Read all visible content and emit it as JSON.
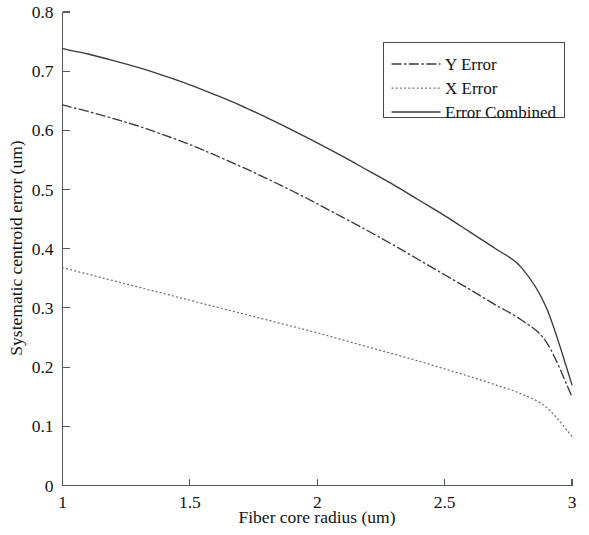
{
  "chart_data": {
    "type": "line",
    "title": "",
    "xlabel": "Fiber core radius (um)",
    "ylabel": "Systematic centroid error (um)",
    "xlim": [
      1,
      3
    ],
    "ylim": [
      0,
      0.8
    ],
    "xticks": [
      1,
      1.5,
      2,
      2.5,
      3
    ],
    "xtick_labels": [
      "1",
      "1.5",
      "2",
      "2.5",
      "3"
    ],
    "yticks": [
      0,
      0.1,
      0.2,
      0.3,
      0.4,
      0.5,
      0.6,
      0.7,
      0.8
    ],
    "ytick_labels": [
      "0",
      "0.1",
      "0.2",
      "0.3",
      "0.4",
      "0.5",
      "0.6",
      "0.7",
      "0.8"
    ],
    "grid": false,
    "legend_position": "upper right",
    "x": [
      1.0,
      1.1,
      1.2,
      1.3,
      1.4,
      1.5,
      1.6,
      1.7,
      1.8,
      1.9,
      2.0,
      2.1,
      2.2,
      2.3,
      2.4,
      2.5,
      2.6,
      2.7,
      2.8,
      2.9,
      3.0
    ],
    "series": [
      {
        "name": "Y Error",
        "style": "dashdot",
        "color": "#3a3a3a",
        "values": [
          0.643,
          0.632,
          0.62,
          0.607,
          0.592,
          0.576,
          0.558,
          0.539,
          0.519,
          0.498,
          0.476,
          0.453,
          0.43,
          0.406,
          0.381,
          0.356,
          0.331,
          0.305,
          0.28,
          0.242,
          0.15
        ]
      },
      {
        "name": "X Error",
        "style": "dotted",
        "color": "#6b6b6b",
        "values": [
          0.368,
          0.357,
          0.346,
          0.335,
          0.324,
          0.313,
          0.302,
          0.291,
          0.28,
          0.269,
          0.258,
          0.246,
          0.234,
          0.222,
          0.21,
          0.197,
          0.184,
          0.17,
          0.155,
          0.132,
          0.083
        ]
      },
      {
        "name": "Error Combined",
        "style": "solid",
        "color": "#3a3a3a",
        "values": [
          0.738,
          0.729,
          0.718,
          0.706,
          0.692,
          0.677,
          0.66,
          0.642,
          0.622,
          0.601,
          0.579,
          0.556,
          0.532,
          0.508,
          0.482,
          0.456,
          0.428,
          0.4,
          0.369,
          0.3,
          0.17
        ]
      }
    ]
  },
  "legend": {
    "entries": [
      {
        "label": "Y Error",
        "style": "dashdot"
      },
      {
        "label": "X Error",
        "style": "dotted"
      },
      {
        "label": "Error Combined",
        "style": "solid"
      }
    ]
  },
  "axes": {
    "x_title": "Fiber core radius (um)",
    "y_title": "Systematic centroid error (um)"
  }
}
